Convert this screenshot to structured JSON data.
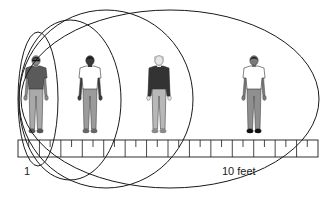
{
  "diagram": {
    "type": "proxemic-distance-diagram",
    "ruler": {
      "start_label": "1",
      "end_label": "10 feet",
      "segments": 14,
      "x": 18,
      "y": 140,
      "width": 300,
      "height": 17
    },
    "zones": [
      {
        "name": "zone-1",
        "cx": 38,
        "cy": 99,
        "rx": 20,
        "ry": 67
      },
      {
        "name": "zone-2",
        "cx": 70,
        "cy": 100,
        "rx": 51,
        "ry": 80
      },
      {
        "name": "zone-3",
        "cx": 106,
        "cy": 99,
        "rx": 87,
        "ry": 89
      },
      {
        "name": "zone-4",
        "cx": 170,
        "cy": 99,
        "rx": 149,
        "ry": 89
      }
    ],
    "people": [
      {
        "name": "person-1",
        "x": 36,
        "shirt": "#5a5a5a",
        "skin": "#8a8a8a",
        "hair": "#222222",
        "pants": "#a9a9a9",
        "shoes": "#555555",
        "sunglasses": true
      },
      {
        "name": "person-2",
        "x": 90,
        "shirt": "#ffffff",
        "skin": "#3a3a3a",
        "hair": "#1a1a1a",
        "pants": "#9b9b9b",
        "shoes": "#666666",
        "sunglasses": false
      },
      {
        "name": "person-3",
        "x": 159,
        "shirt": "#333333",
        "skin": "#e6e6e6",
        "hair": "#bdbdbd",
        "pants": "#b8b8b8",
        "shoes": "#8a8a8a",
        "sunglasses": false
      },
      {
        "name": "person-4",
        "x": 254,
        "shirt": "#ffffff",
        "skin": "#7a7a7a",
        "hair": "#1e1e1e",
        "pants": "#8f8f8f",
        "shoes": "#111111",
        "sunglasses": false
      }
    ],
    "colors": {
      "stroke": "#1a1a1a",
      "background": "#ffffff"
    }
  }
}
